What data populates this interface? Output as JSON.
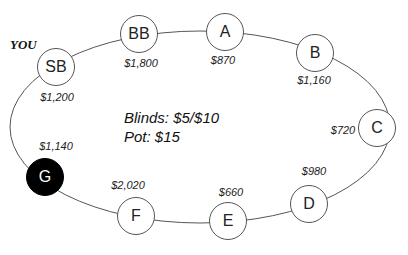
{
  "you_label": "YOU",
  "center": {
    "blinds": "Blinds: $5/$10",
    "pot": "Pot: $15"
  },
  "seats": [
    {
      "id": "SB",
      "label": "SB",
      "stack": "$1,200",
      "x": 56,
      "y": 67,
      "sx": 57,
      "sy": 97,
      "filled": false
    },
    {
      "id": "BB",
      "label": "BB",
      "stack": "$1,800",
      "x": 139,
      "y": 34,
      "sx": 141,
      "sy": 63,
      "filled": false
    },
    {
      "id": "A",
      "label": "A",
      "stack": "$870",
      "x": 225,
      "y": 32,
      "sx": 223,
      "sy": 60,
      "filled": false
    },
    {
      "id": "B",
      "label": "B",
      "stack": "$1,160",
      "x": 315,
      "y": 53,
      "sx": 314,
      "sy": 80,
      "filled": false
    },
    {
      "id": "C",
      "label": "C",
      "stack": "$720",
      "x": 377,
      "y": 128,
      "sx": 343,
      "sy": 130,
      "filled": false
    },
    {
      "id": "D",
      "label": "D",
      "stack": "$980",
      "x": 309,
      "y": 204,
      "sx": 314,
      "sy": 171,
      "filled": false
    },
    {
      "id": "E",
      "label": "E",
      "stack": "$660",
      "x": 228,
      "y": 221,
      "sx": 231,
      "sy": 192,
      "filled": false
    },
    {
      "id": "F",
      "label": "F",
      "stack": "$2,020",
      "x": 136,
      "y": 216,
      "sx": 128,
      "sy": 185,
      "filled": false
    },
    {
      "id": "G",
      "label": "G",
      "stack": "$1,140",
      "x": 45,
      "y": 177,
      "sx": 56,
      "sy": 146,
      "filled": true
    }
  ],
  "colors": {
    "line": "#555555",
    "filled_seat": "#000000"
  }
}
